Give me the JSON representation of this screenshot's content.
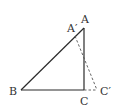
{
  "diagram": {
    "type": "geometry-triangle-rotation",
    "colors": {
      "solid": "#2a2a2a",
      "dashed": "#555555",
      "label": "#333333"
    },
    "points": {
      "A": {
        "label": "A",
        "x": 84,
        "y": 28
      },
      "A_prime": {
        "label": "A′",
        "x": 75,
        "y": 35
      },
      "B": {
        "label": "B",
        "x": 21,
        "y": 90
      },
      "C": {
        "label": "C",
        "x": 84,
        "y": 90
      },
      "C_prime": {
        "label": "C′",
        "x": 97,
        "y": 90
      }
    },
    "segments": [
      {
        "from": "A",
        "to": "B",
        "style": "solid"
      },
      {
        "from": "B",
        "to": "C",
        "style": "solid"
      },
      {
        "from": "C",
        "to": "A",
        "style": "solid"
      },
      {
        "from": "A_prime",
        "to": "C_prime",
        "style": "dashed"
      },
      {
        "from": "C",
        "to": "C_prime",
        "style": "dashed"
      }
    ]
  }
}
